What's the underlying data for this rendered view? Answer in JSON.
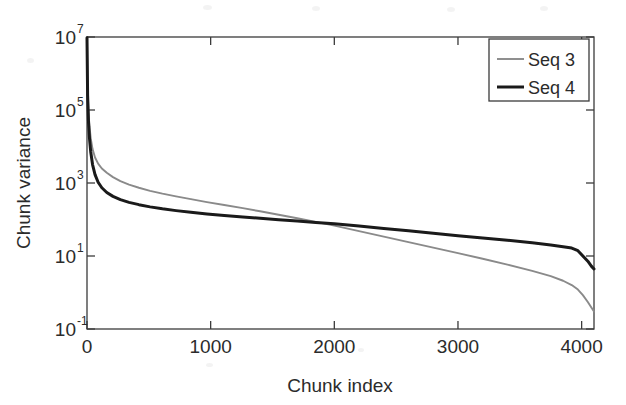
{
  "chart_data": {
    "type": "line",
    "title": "",
    "xlabel": "Chunk index",
    "ylabel": "Chunk variance",
    "xlim": [
      0,
      4100
    ],
    "ylim": [
      0.1,
      10000000
    ],
    "yscale": "log",
    "xscale": "linear",
    "grid": false,
    "legend_position": "top-right",
    "xticks": [
      0,
      1000,
      2000,
      3000,
      4000
    ],
    "xticklabels": [
      "0",
      "1000",
      "2000",
      "3000",
      "4000"
    ],
    "yticks": [
      0.1,
      10,
      1000,
      100000,
      10000000
    ],
    "yticklabels": [
      "10^-1",
      "10^1",
      "10^3",
      "10^5",
      "10^7"
    ],
    "ytick_mantissa": "10",
    "ytick_exponents": [
      "-1",
      "1",
      "3",
      "5",
      "7"
    ],
    "series": [
      {
        "name": "Seq 3",
        "color": "#8a8a8a",
        "width": 1.9,
        "x": [
          0,
          5,
          12,
          20,
          30,
          45,
          65,
          90,
          120,
          160,
          210,
          270,
          340,
          420,
          510,
          610,
          720,
          840,
          970,
          1110,
          1260,
          1400,
          1550,
          1700,
          1850,
          2000,
          2200,
          2400,
          2600,
          2800,
          3000,
          3200,
          3400,
          3600,
          3750,
          3850,
          3920,
          3970,
          4010,
          4050,
          4080,
          4100
        ],
        "y": [
          9500000,
          400000,
          90000,
          36000,
          17000,
          8500,
          5000,
          3400,
          2500,
          1900,
          1450,
          1120,
          900,
          740,
          610,
          510,
          430,
          360,
          300,
          250,
          205,
          168,
          135,
          108,
          86,
          68,
          48,
          34,
          24,
          17,
          12,
          8.4,
          5.8,
          3.9,
          2.8,
          2.1,
          1.6,
          1.2,
          0.85,
          0.55,
          0.38,
          0.3
        ]
      },
      {
        "name": "Seq 4",
        "color": "#1a1a1a",
        "width": 3.0,
        "x": [
          0,
          5,
          12,
          20,
          30,
          45,
          65,
          90,
          120,
          160,
          210,
          270,
          340,
          420,
          510,
          610,
          720,
          840,
          970,
          1110,
          1260,
          1400,
          1550,
          1700,
          1850,
          2000,
          2200,
          2400,
          2600,
          2800,
          3000,
          3200,
          3400,
          3600,
          3750,
          3850,
          3920,
          3970,
          4010,
          4050,
          4080,
          4100
        ],
        "y": [
          9500000,
          250000,
          48000,
          17000,
          7200,
          3200,
          1700,
          1050,
          740,
          550,
          430,
          350,
          295,
          255,
          222,
          196,
          175,
          157,
          142,
          129,
          118,
          108,
          99,
          91,
          83,
          76,
          66,
          57,
          49,
          42,
          36,
          31,
          27,
          23,
          20,
          18,
          16.5,
          14,
          10,
          7.2,
          5.2,
          4.4
        ]
      }
    ],
    "legend": [
      {
        "label": "Seq 3",
        "color": "#8a8a8a",
        "width": 1.9
      },
      {
        "label": "Seq 4",
        "color": "#1a1a1a",
        "width": 3.0
      }
    ]
  }
}
